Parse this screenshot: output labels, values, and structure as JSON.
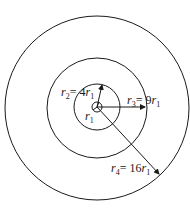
{
  "diagram": {
    "type": "concentric-circles",
    "center": {
      "x": 97,
      "y": 107
    },
    "circles": [
      {
        "name": "r1",
        "radius_px": 5
      },
      {
        "name": "r2",
        "radius_px": 23
      },
      {
        "name": "r3",
        "radius_px": 50
      },
      {
        "name": "r4",
        "radius_px": 92
      }
    ],
    "labels": {
      "r1": {
        "sym": "r",
        "sub": "1"
      },
      "r2": {
        "sym": "r",
        "sub": "2",
        "eq": "= 4",
        "sym2": "r",
        "sub2": "1"
      },
      "r3": {
        "sym": "r",
        "sub": "3",
        "eq": "= 9",
        "sym2": "r",
        "sub2": "1"
      },
      "r4": {
        "sym": "r",
        "sub": "4",
        "eq": "= 16",
        "sym2": "r",
        "sub2": "1"
      }
    }
  }
}
